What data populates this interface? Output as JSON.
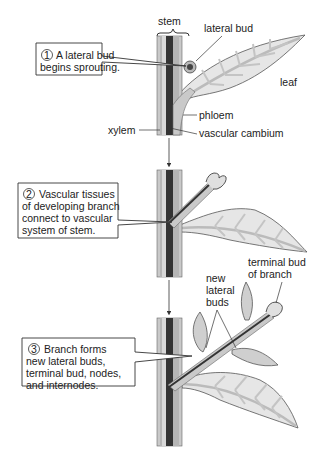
{
  "diagram": {
    "type": "biology-illustration",
    "topic": "Branch development from a lateral bud",
    "colors": {
      "stem_outer": "#c9c9c9",
      "phloem": "#b5b5b5",
      "xylem": "#d8d8d8",
      "cambium": "#333333",
      "leaf_fill": "#e6e6e6",
      "leaf_vein": "#c4c4c4",
      "bud_fill": "#cfcfcf",
      "line": "#222222"
    },
    "stage1": {
      "step_number": "1",
      "box_lines": [
        "A lateral bud",
        "begins sprouting."
      ],
      "labels": {
        "stem": "stem",
        "lateral_bud": "lateral bud",
        "leaf": "leaf",
        "phloem": "phloem",
        "xylem": "xylem",
        "vascular_cambium": "vascular cambium"
      }
    },
    "stage2": {
      "step_number": "2",
      "box_lines": [
        "Vascular tissues",
        "of developing branch",
        "connect to vascular",
        "system of stem."
      ]
    },
    "stage3": {
      "step_number": "3",
      "box_lines": [
        "Branch forms",
        "new lateral buds,",
        "terminal bud, nodes,",
        "and internodes."
      ],
      "labels": {
        "new_lateral_buds": [
          "new",
          "lateral",
          "buds"
        ],
        "terminal_bud": [
          "terminal bud",
          "of branch"
        ]
      }
    }
  }
}
